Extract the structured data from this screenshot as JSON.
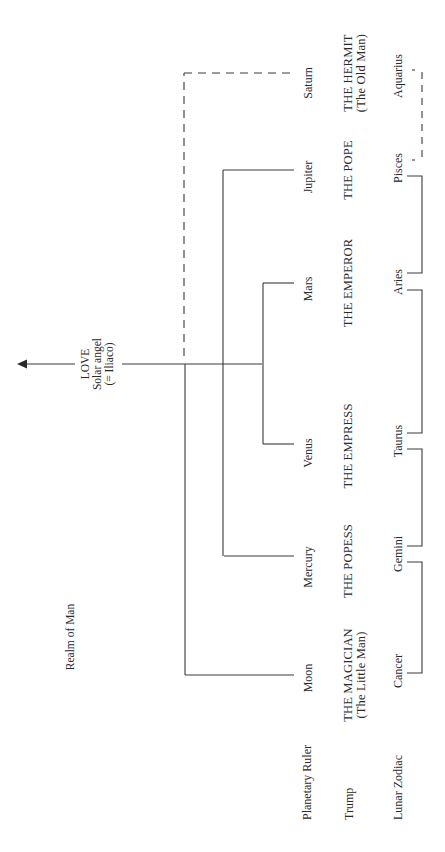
{
  "diagram": {
    "top_label": {
      "line1": "LOVE",
      "line2": "Solar angel",
      "line3": "(= Iliaco)"
    },
    "realm_label": "Realm of Man",
    "row_labels": {
      "planetary_ruler": "Planetary Ruler",
      "trump": "Trump",
      "lunar_zodiac": "Lunar Zodiac"
    },
    "columns": [
      {
        "planet": "Moon",
        "trump": "THE MAGICIAN",
        "trump_sub": "(The Little Man)",
        "zodiac": "Cancer"
      },
      {
        "planet": "Mercury",
        "trump": "THE POPESS",
        "trump_sub": "",
        "zodiac": "Gemini"
      },
      {
        "planet": "Venus",
        "trump": "THE EMPRESS",
        "trump_sub": "",
        "zodiac": "Taurus"
      },
      {
        "planet": "Mars",
        "trump": "THE EMPEROR",
        "trump_sub": "",
        "zodiac": "Aries"
      },
      {
        "planet": "Jupiter",
        "trump": "THE POPE",
        "trump_sub": "",
        "zodiac": "Pisces"
      },
      {
        "planet": "Saturn",
        "trump": "THE HERMIT",
        "trump_sub": "(The Old Man)",
        "zodiac": "Aquarius"
      }
    ],
    "colors": {
      "line": "#3a3a3a",
      "text": "#2a2a2a",
      "background": "#ffffff"
    },
    "connections": {
      "saturn_link": "dashed",
      "aquarius_pisces_link": "dashed",
      "others": "solid"
    }
  }
}
